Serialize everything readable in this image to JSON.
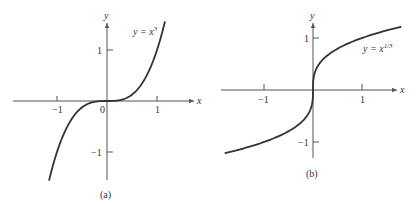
{
  "chart_data": [
    {
      "type": "line",
      "panel": "(a)",
      "title": "",
      "caption": "(a)",
      "xlabel": "x",
      "ylabel": "y",
      "annotation": "y = x³",
      "annotation_base": "y = x",
      "annotation_sup": "3",
      "xlim": [
        -1.16,
        1.16
      ],
      "ylim": [
        -1.56,
        1.56
      ],
      "x_ticks": [
        "-1",
        "0",
        "1"
      ],
      "x_tick_labels": [
        "−1",
        "0",
        "1"
      ],
      "y_ticks": [
        "1",
        "-1"
      ],
      "y_tick_labels": [
        "1",
        "−1"
      ],
      "grid": false,
      "series": [
        {
          "name": "y = x^3",
          "x": [
            -1.16,
            -1.0,
            -0.8,
            -0.6,
            -0.4,
            -0.2,
            0,
            0.2,
            0.4,
            0.6,
            0.8,
            1.0,
            1.16
          ],
          "y": [
            -1.561,
            -1.0,
            -0.512,
            -0.216,
            -0.064,
            -0.008,
            0,
            0.008,
            0.064,
            0.216,
            0.512,
            1.0,
            1.561
          ]
        }
      ]
    },
    {
      "type": "line",
      "panel": "(b)",
      "title": "",
      "caption": "(b)",
      "xlabel": "x",
      "ylabel": "y",
      "annotation": "y = x^(1/3)",
      "annotation_base": "y = x",
      "annotation_sup": "1/3",
      "xlim": [
        -1.8,
        1.8
      ],
      "ylim": [
        -1.22,
        1.22
      ],
      "x_ticks": [
        "-1",
        "1"
      ],
      "x_tick_labels": [
        "−1",
        "1"
      ],
      "y_ticks": [
        "1",
        "-1"
      ],
      "y_tick_labels": [
        "1",
        "−1"
      ],
      "grid": false,
      "series": [
        {
          "name": "y = x^(1/3)",
          "x": [
            -1.8,
            -1.0,
            -0.5,
            -0.1,
            -0.01,
            0,
            0.01,
            0.1,
            0.5,
            1.0,
            1.8
          ],
          "y": [
            -1.216,
            -1.0,
            -0.794,
            -0.464,
            -0.215,
            0,
            0.215,
            0.464,
            0.794,
            1.0,
            1.216
          ]
        }
      ]
    }
  ]
}
